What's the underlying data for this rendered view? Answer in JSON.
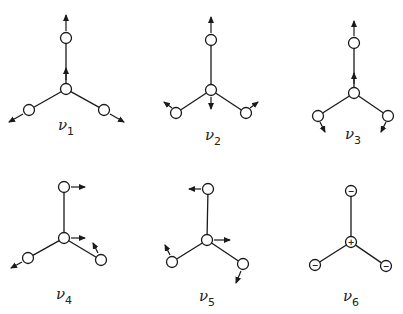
{
  "figure": {
    "modes": [
      {
        "id": "nu1",
        "label": "ν",
        "subscript": "1",
        "center": [
          66,
          89
        ],
        "atoms": {
          "top": [
            66,
            38
          ],
          "left": [
            29,
            110
          ],
          "right": [
            104,
            110
          ]
        },
        "label_pos": [
          58,
          130
        ],
        "arrows": [
          {
            "from": [
              66,
              31
            ],
            "to": [
              66,
              15
            ]
          },
          {
            "from": [
              66,
              80
            ],
            "to": [
              66,
              68
            ]
          },
          {
            "from": [
              23,
              114
            ],
            "to": [
              9,
              122
            ]
          },
          {
            "from": [
              110,
              114
            ],
            "to": [
              124,
              122
            ]
          }
        ],
        "signs": null
      },
      {
        "id": "nu2",
        "label": "ν",
        "subscript": "2",
        "center": [
          211,
          90
        ],
        "atoms": {
          "top": [
            211,
            40
          ],
          "left": [
            176,
            113
          ],
          "right": [
            246,
            113
          ]
        },
        "label_pos": [
          205,
          140
        ],
        "arrows": [
          {
            "from": [
              211,
              33
            ],
            "to": [
              211,
              17
            ]
          },
          {
            "from": [
              211,
              97
            ],
            "to": [
              211,
              109
            ]
          },
          {
            "from": [
              172,
              108
            ],
            "to": [
              164,
              102
            ]
          },
          {
            "from": [
              250,
              108
            ],
            "to": [
              258,
              102
            ]
          }
        ],
        "signs": null
      },
      {
        "id": "nu3",
        "label": "ν",
        "subscript": "3",
        "center": [
          354,
          93
        ],
        "atoms": {
          "top": [
            354,
            43
          ],
          "left": [
            318,
            116
          ],
          "right": [
            388,
            116
          ]
        },
        "label_pos": [
          345,
          139
        ],
        "arrows": [
          {
            "from": [
              354,
              36
            ],
            "to": [
              354,
              21
            ]
          },
          {
            "from": [
              354,
              84
            ],
            "to": [
              354,
              73
            ]
          },
          {
            "from": [
              320,
              122
            ],
            "to": [
              325,
              132
            ]
          },
          {
            "from": [
              386,
              122
            ],
            "to": [
              381,
              132
            ]
          }
        ],
        "signs": null
      },
      {
        "id": "nu4",
        "label": "ν",
        "subscript": "4",
        "center": [
          64,
          238
        ],
        "atoms": {
          "top": [
            64,
            187
          ],
          "left": [
            28,
            258
          ],
          "right": [
            101,
            260
          ]
        },
        "label_pos": [
          56,
          299
        ],
        "arrows": [
          {
            "from": [
              71,
              187
            ],
            "to": [
              85,
              187
            ]
          },
          {
            "from": [
              71,
              238
            ],
            "to": [
              85,
              238
            ]
          },
          {
            "from": [
              22,
              262
            ],
            "to": [
              11,
              268
            ]
          },
          {
            "from": [
              98,
              253
            ],
            "to": [
              93,
              243
            ]
          }
        ],
        "signs": null
      },
      {
        "id": "nu5",
        "label": "ν",
        "subscript": "5",
        "center": [
          207,
          240
        ],
        "atoms": {
          "top": [
            208,
            189
          ],
          "left": [
            172,
            262
          ],
          "right": [
            243,
            264
          ]
        },
        "label_pos": [
          199,
          301
        ],
        "arrows": [
          {
            "from": [
              201,
              189
            ],
            "to": [
              189,
              189
            ]
          },
          {
            "from": [
              214,
              240
            ],
            "to": [
              230,
              240
            ]
          },
          {
            "from": [
              170,
              255
            ],
            "to": [
              165,
              245
            ]
          },
          {
            "from": [
              241,
              271
            ],
            "to": [
              236,
              283
            ]
          }
        ],
        "signs": null
      },
      {
        "id": "nu6",
        "label": "ν",
        "subscript": "6",
        "center": [
          351,
          242
        ],
        "atoms": {
          "top": [
            351,
            191
          ],
          "left": [
            315,
            265
          ],
          "right": [
            386,
            266
          ]
        },
        "label_pos": [
          343,
          301
        ],
        "arrows": [],
        "signs": {
          "center": "+",
          "top": "−",
          "left": "−",
          "right": "−"
        }
      }
    ]
  }
}
